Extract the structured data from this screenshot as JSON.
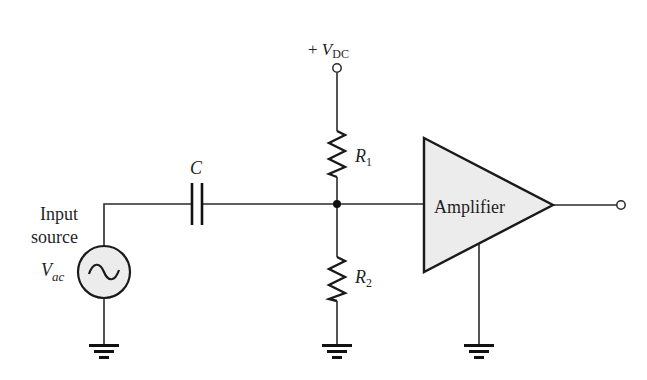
{
  "diagram": {
    "type": "circuit-schematic",
    "colors": {
      "wire": "#2a2a2a",
      "component_fill": "#ececec",
      "background": "#ffffff",
      "text": "#1f1f1f"
    },
    "supply": {
      "prefix": "+ ",
      "symbol": "V",
      "subscript": "DC"
    },
    "input_source": {
      "label_line1": "Input",
      "label_line2": "source",
      "symbol": "V",
      "subscript": "ac",
      "glyph": "~"
    },
    "capacitor": {
      "label": "C"
    },
    "resistors": [
      {
        "symbol": "R",
        "subscript": "1"
      },
      {
        "symbol": "R",
        "subscript": "2"
      }
    ],
    "amplifier": {
      "label": "Amplifier"
    },
    "grounds": [
      "source-ground",
      "r2-ground",
      "amplifier-ground"
    ],
    "terminals": [
      "vdc-terminal",
      "output-terminal"
    ]
  }
}
